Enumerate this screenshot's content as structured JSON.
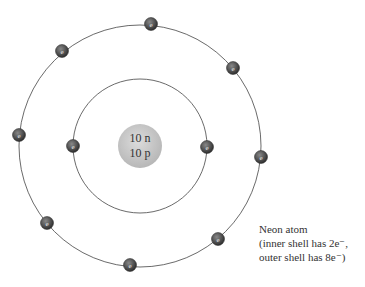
{
  "atom": {
    "name": "Neon atom",
    "nucleus": {
      "neutrons_label": "10 n",
      "protons_label": "10 p",
      "center": [
        140,
        146
      ],
      "radius": 22,
      "color": "#c8c8c8"
    },
    "shells": [
      {
        "name": "inner",
        "radius": 67,
        "electron_count": 2
      },
      {
        "name": "outer",
        "radius": 121,
        "electron_count": 8
      }
    ],
    "electron_label": "e",
    "electrons": [
      {
        "shell": "inner",
        "x": 73,
        "y": 146
      },
      {
        "shell": "inner",
        "x": 207,
        "y": 147
      },
      {
        "shell": "outer",
        "x": 151,
        "y": 24
      },
      {
        "shell": "outer",
        "x": 62,
        "y": 51
      },
      {
        "shell": "outer",
        "x": 233,
        "y": 68
      },
      {
        "shell": "outer",
        "x": 19,
        "y": 135
      },
      {
        "shell": "outer",
        "x": 261,
        "y": 157
      },
      {
        "shell": "outer",
        "x": 47,
        "y": 223
      },
      {
        "shell": "outer",
        "x": 218,
        "y": 239
      },
      {
        "shell": "outer",
        "x": 130,
        "y": 265
      }
    ]
  },
  "caption": {
    "title": "Neon atom",
    "line2": "(inner shell has 2e⁻,",
    "line3": "outer shell has 8e⁻)"
  }
}
